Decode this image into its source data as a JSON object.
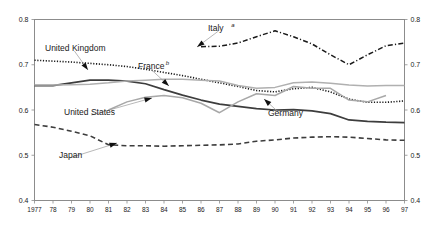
{
  "chart_data": {
    "type": "line",
    "title": "",
    "xlabel": "",
    "ylabel": "",
    "xlim": [
      1977,
      1997
    ],
    "ylim": [
      0.4,
      0.8
    ],
    "grid": false,
    "legend_position": "inline-annotations",
    "axis": {
      "y_ticks": [
        "0.4",
        "0.5",
        "0.6",
        "0.7",
        "0.8"
      ],
      "y_tick_values": [
        0.4,
        0.5,
        0.6,
        0.7,
        0.8
      ],
      "y_ticks_right": [
        "0.4",
        "0.5",
        "0.6",
        "0.7",
        "0.8"
      ],
      "x_ticks": [
        "1977",
        "78",
        "79",
        "80",
        "81",
        "82",
        "83",
        "84",
        "85",
        "86",
        "87",
        "88",
        "89",
        "90",
        "91",
        "92",
        "93",
        "94",
        "95",
        "96",
        "97"
      ],
      "x_tick_values": [
        1977,
        1978,
        1979,
        1980,
        1981,
        1982,
        1983,
        1984,
        1985,
        1986,
        1987,
        1988,
        1989,
        1990,
        1991,
        1992,
        1993,
        1994,
        1995,
        1996,
        1997
      ]
    },
    "x": [
      1977,
      1978,
      1979,
      1980,
      1981,
      1982,
      1983,
      1984,
      1985,
      1986,
      1987,
      1988,
      1989,
      1990,
      1991,
      1992,
      1993,
      1994,
      1995,
      1996,
      1997
    ],
    "series": [
      {
        "name": "United Kingdom",
        "label": "United Kingdom",
        "superscript": "",
        "style": "dotted",
        "color": "#1a1a1a",
        "width": 1.6,
        "values": [
          0.71,
          0.708,
          0.706,
          0.703,
          0.7,
          0.696,
          0.69,
          0.683,
          0.676,
          0.668,
          0.66,
          0.652,
          0.643,
          0.64,
          0.647,
          0.65,
          0.64,
          0.624,
          0.617,
          0.617,
          0.62
        ]
      },
      {
        "name": "United States",
        "label": "United States",
        "superscript": "",
        "style": "solid",
        "color": "#3d3d3d",
        "width": 1.7,
        "values": [
          0.654,
          0.654,
          0.66,
          0.666,
          0.666,
          0.664,
          0.658,
          0.645,
          0.633,
          0.622,
          0.613,
          0.608,
          0.603,
          0.6,
          0.601,
          0.598,
          0.592,
          0.578,
          0.575,
          0.573,
          0.572
        ]
      },
      {
        "name": "France",
        "label": "France",
        "superscript": "b",
        "style": "solid-light",
        "color": "#b0b0b0",
        "width": 1.5,
        "values": [
          0.655,
          0.655,
          0.656,
          0.657,
          0.66,
          0.664,
          0.666,
          0.668,
          0.668,
          0.666,
          0.664,
          0.654,
          0.648,
          0.65,
          0.66,
          0.662,
          0.659,
          0.655,
          0.653,
          0.654,
          0.654
        ]
      },
      {
        "name": "Germany",
        "label": "Germany",
        "superscript": "",
        "style": "solid-light",
        "color": "#a8a8a8",
        "width": 1.5,
        "values": [
          null,
          null,
          null,
          null,
          0.6,
          0.618,
          0.628,
          0.632,
          0.627,
          0.615,
          0.594,
          0.618,
          0.636,
          0.632,
          0.652,
          0.648,
          0.648,
          0.622,
          0.618,
          0.632,
          null
        ]
      },
      {
        "name": "Italy",
        "label": "Italy",
        "superscript": "a",
        "style": "dash-dot",
        "color": "#1a1a1a",
        "width": 1.5,
        "values": [
          null,
          null,
          null,
          null,
          null,
          null,
          null,
          null,
          null,
          0.74,
          0.741,
          0.748,
          0.762,
          0.775,
          0.762,
          0.746,
          0.722,
          0.7,
          0.722,
          0.742,
          0.748
        ]
      },
      {
        "name": "Japan",
        "label": "Japan",
        "superscript": "",
        "style": "dashed",
        "color": "#3d3d3d",
        "width": 1.6,
        "values": [
          0.568,
          0.562,
          0.553,
          0.543,
          0.523,
          0.521,
          0.521,
          0.52,
          0.521,
          0.522,
          0.523,
          0.525,
          0.531,
          0.534,
          0.538,
          0.54,
          0.541,
          0.54,
          0.537,
          0.534,
          0.533
        ]
      }
    ],
    "annotations": [
      {
        "text": "United Kingdom",
        "superscript": "",
        "x": 45,
        "y": 48,
        "anchor_x": 88,
        "anchor_y": 70
      },
      {
        "text": "France",
        "superscript": "b",
        "x": 138,
        "y": 66,
        "anchor_x": 169,
        "anchor_y": 86
      },
      {
        "text": "United States",
        "superscript": "",
        "x": 64,
        "y": 112,
        "anchor_x": 152,
        "anchor_y": 98
      },
      {
        "text": "Germany",
        "superscript": "",
        "x": 268,
        "y": 113,
        "anchor_x": 264,
        "anchor_y": 99
      },
      {
        "text": "Italy",
        "superscript": "a",
        "x": 208,
        "y": 28,
        "anchor_x": 197,
        "anchor_y": 47
      },
      {
        "text": "Japan",
        "superscript": "",
        "x": 59,
        "y": 155,
        "anchor_x": 117,
        "anchor_y": 143
      }
    ]
  }
}
